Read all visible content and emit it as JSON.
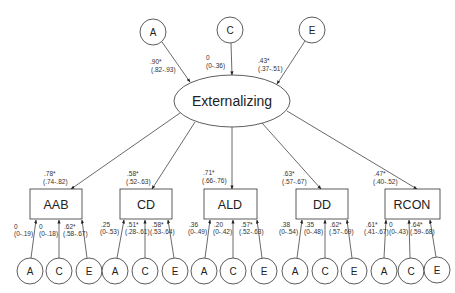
{
  "latent": {
    "label": "Externalizing",
    "sources": [
      {
        "label": "A",
        "coef": ".90*",
        "ci": "(.82-.93)"
      },
      {
        "label": "C",
        "coef": "0",
        "ci": "(0-.36)"
      },
      {
        "label": "E",
        "coef": ".43*",
        "ci": "(.37-.51)"
      }
    ]
  },
  "indicators": [
    {
      "label": "AAB",
      "loading": ".78*",
      "loading_ci": "(.74-.82)",
      "specific": [
        {
          "label": "A",
          "coef": "0",
          "ci": "(0-.19)"
        },
        {
          "label": "C",
          "coef": "0",
          "ci": "(0-.18)"
        },
        {
          "label": "E",
          "coef": ".62*",
          "ci": "(.58-.67)"
        }
      ]
    },
    {
      "label": "CD",
      "loading": ".58*",
      "loading_ci": "(.52-.63)",
      "specific": [
        {
          "label": "A",
          "coef": ".25",
          "ci": "(0-.53)"
        },
        {
          "label": "C",
          "coef": ".51*",
          "ci": "(.28-.61)"
        },
        {
          "label": "E",
          "coef": ".58*",
          "ci": "(.53-.64)"
        }
      ]
    },
    {
      "label": "ALD",
      "loading": ".71*",
      "loading_ci": "(.66-.76)",
      "specific": [
        {
          "label": "A",
          "coef": ".36",
          "ci": "(0-.49)"
        },
        {
          "label": "C",
          "coef": ".20",
          "ci": "(0-.42)"
        },
        {
          "label": "E",
          "coef": ".57*",
          "ci": "(.52-.63)"
        }
      ]
    },
    {
      "label": "DD",
      "loading": ".63*",
      "loading_ci": "(.57-.67)",
      "specific": [
        {
          "label": "A",
          "coef": ".38",
          "ci": "(0-.54)"
        },
        {
          "label": "C",
          "coef": ".35",
          "ci": "(0-.48)"
        },
        {
          "label": "E",
          "coef": ".62*",
          "ci": "(.57-.69)"
        }
      ]
    },
    {
      "label": "RCON",
      "loading": ".47*",
      "loading_ci": "(.40-.52)",
      "specific": [
        {
          "label": "A",
          "coef": ".61*",
          "ci": "(.41-.67)"
        },
        {
          "label": "C",
          "coef": "0",
          "ci": "(0-.43)"
        },
        {
          "label": "E",
          "coef": ".64*",
          "ci": "(.59-.68)"
        }
      ]
    }
  ]
}
